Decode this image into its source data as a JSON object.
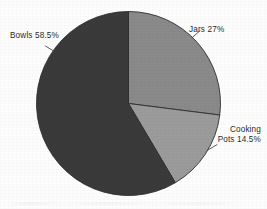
{
  "chart_data": {
    "type": "pie",
    "title": "",
    "subtitle": "",
    "xlabel": "",
    "ylabel": "",
    "legend_position": "none",
    "grid": false,
    "labels_placement": "outside-with-leader-lines",
    "start_angle_deg": 0,
    "direction": "clockwise",
    "categories": [
      "Jars",
      "Cooking Pots",
      "Bowls"
    ],
    "values": [
      27,
      14.5,
      58.5
    ],
    "units": "percent",
    "slices": [
      {
        "name": "Jars",
        "value": 27,
        "label": "Jars 27%",
        "color": "#8a8a8a",
        "start_deg": 0,
        "end_deg": 97.2
      },
      {
        "name": "Cooking Pots",
        "value": 14.5,
        "label_line1": "Cooking",
        "label_line2": "Pots 14.5%",
        "label": "Cooking Pots 14.5%",
        "color": "#9b9b9b",
        "start_deg": 97.2,
        "end_deg": 149.4
      },
      {
        "name": "Bowls",
        "value": 58.5,
        "label": "Bowls 58.5%",
        "color": "#3a3a3a",
        "start_deg": 149.4,
        "end_deg": 360
      }
    ]
  },
  "labels": {
    "bowls": "Bowls 58.5%",
    "jars": "Jars 27%",
    "cooking_pots_line1": "Cooking",
    "cooking_pots_line2": "Pots 14.5%"
  },
  "colors": {
    "background": "#fdfdfd",
    "bowls": "#3a3a3a",
    "jars": "#8a8a8a",
    "cooking_pots": "#9b9b9b",
    "outline": "#2f2f2f",
    "text": "#2b2b2b",
    "leader_line": "#4a4a4a"
  },
  "geometry": {
    "center_x": 128.5,
    "center_y": 103.5,
    "radius": 92
  }
}
